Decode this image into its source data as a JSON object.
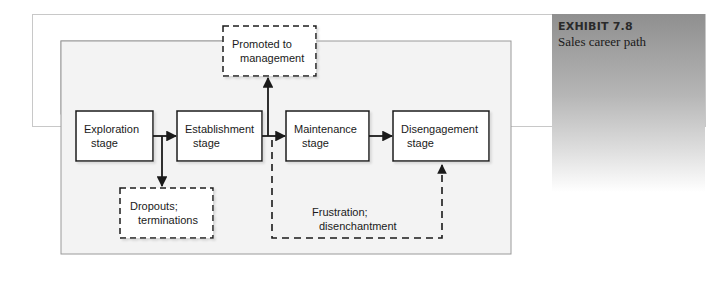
{
  "exhibit": {
    "number": "EXHIBIT 7.8",
    "title": "Sales career path"
  },
  "diagram": {
    "stages": [
      {
        "id": "exploration",
        "line1": "Exploration",
        "line2": "stage"
      },
      {
        "id": "establishment",
        "line1": "Establishment",
        "line2": "stage"
      },
      {
        "id": "maintenance",
        "line1": "Maintenance",
        "line2": "stage"
      },
      {
        "id": "disengagement",
        "line1": "Disengagement",
        "line2": "stage"
      }
    ],
    "outcomes": {
      "promoted": {
        "line1": "Promoted to",
        "line2": "management"
      },
      "dropouts": {
        "line1": "Dropouts;",
        "line2": "terminations"
      },
      "frustration": {
        "line1": "Frustration;",
        "line2": "disenchantment"
      }
    },
    "colors": {
      "panel_bg": "#f3f3f3",
      "box_bg": "#ffffff",
      "line": "#1a1a1a"
    }
  }
}
